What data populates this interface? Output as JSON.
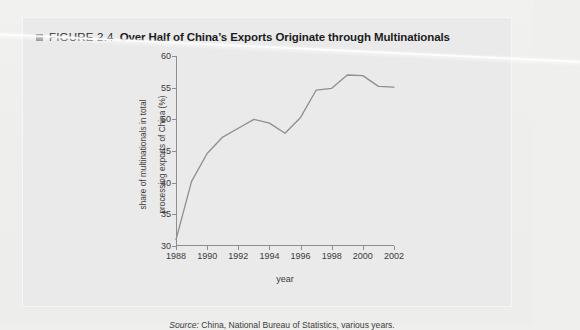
{
  "figure": {
    "bullet_icon": "square-bullet-icon",
    "number_label": "FIGURE 2.4",
    "caption": "Over Half of China’s Exports Originate through Multinationals",
    "source_prefix": "Source:",
    "source_text": " China, National Bureau of Statistics, various years."
  },
  "chart_data": {
    "type": "line",
    "title": "Over Half of China’s Exports Originate through Multinationals",
    "xlabel": "year",
    "ylabel": "share of multinationals in total processing exports of China (%)",
    "ylabel_line1": "share of multinationals in total",
    "ylabel_line2": "processing exports of China (%)",
    "xlim": [
      1988,
      2002
    ],
    "ylim": [
      30,
      60
    ],
    "yticks": [
      30,
      35,
      40,
      45,
      50,
      55,
      60
    ],
    "xticks": [
      1988,
      1990,
      1992,
      1994,
      1996,
      1998,
      2000,
      2002
    ],
    "grid": false,
    "legend": "none",
    "line_color": "#8e8e8e",
    "x": [
      1988,
      1989,
      1990,
      1991,
      1992,
      1993,
      1994,
      1995,
      1996,
      1997,
      1998,
      1999,
      2000,
      2001,
      2002
    ],
    "values": [
      31.0,
      40.2,
      44.6,
      47.2,
      48.6,
      50.0,
      49.4,
      47.8,
      50.3,
      54.6,
      54.9,
      57.0,
      56.9,
      55.2,
      55.1
    ],
    "series": [
      {
        "name": "share of multinationals in total processing exports of China (%)",
        "values": [
          31.0,
          40.2,
          44.6,
          47.2,
          48.6,
          50.0,
          49.4,
          47.8,
          50.3,
          54.6,
          54.9,
          57.0,
          56.9,
          55.2,
          55.1
        ]
      }
    ]
  }
}
